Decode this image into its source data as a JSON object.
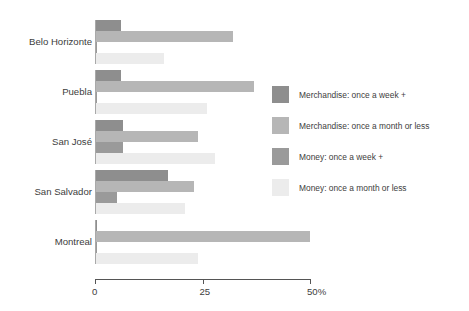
{
  "chart_data": {
    "type": "bar",
    "orientation": "horizontal",
    "grouped": true,
    "title": "",
    "xlabel": "",
    "ylabel": "",
    "xlim": [
      0,
      50
    ],
    "grid": false,
    "legend_position": "right",
    "categories": [
      "Belo Horizonte",
      "Puebla",
      "San José",
      "San Salvador",
      "Montreal"
    ],
    "xticks": [
      {
        "value": 0,
        "label": "0"
      },
      {
        "value": 25,
        "label": "25"
      },
      {
        "value": 50,
        "label": "50%"
      }
    ],
    "series": [
      {
        "name": "Merchandise: once a week +",
        "color": "#8e8e8e",
        "values": [
          6,
          6,
          6.5,
          17,
          0.5
        ]
      },
      {
        "name": "Merchandise: once a month or less",
        "color": "#b6b6b6",
        "values": [
          32,
          37,
          24,
          23,
          50
        ]
      },
      {
        "name": "Money: once a week +",
        "color": "#9a9a9a",
        "values": [
          0.5,
          0.5,
          6.5,
          5,
          0.5
        ]
      },
      {
        "name": "Money: once a month or less",
        "color": "#ececec",
        "values": [
          16,
          26,
          28,
          21,
          24
        ]
      }
    ]
  },
  "legend": {
    "items": [
      {
        "label": "Merchandise: once a week +",
        "color": "#8e8e8e"
      },
      {
        "label": "Merchandise: once a month or less",
        "color": "#b6b6b6"
      },
      {
        "label": "Money: once a week +",
        "color": "#9a9a9a"
      },
      {
        "label": "Money: once a month or less",
        "color": "#ececec"
      }
    ]
  },
  "axis": {
    "tick_labels": [
      "0",
      "25",
      "50%"
    ],
    "axis_color": "#555555"
  }
}
